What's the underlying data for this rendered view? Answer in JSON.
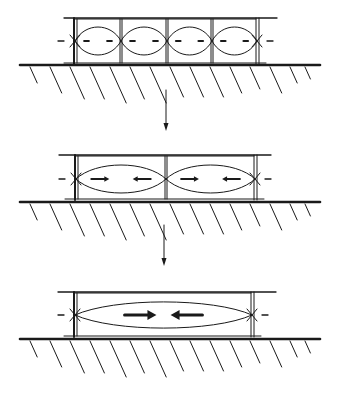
{
  "diagram": {
    "title": "",
    "colors": {
      "ink": "#1a1a1a",
      "background": "#ffffff"
    },
    "panels": [
      {
        "id": "panel-1",
        "cells": 4,
        "box": {
          "x0": 74,
          "x1": 256,
          "top": 19,
          "bottom": 63
        },
        "top_line": {
          "x0": 64,
          "x1": 277,
          "y": 18
        },
        "ground_y": 65,
        "node_y": 41,
        "amplitude": 15,
        "arrow_style": "dash",
        "dividers": [
          120,
          166,
          211
        ]
      },
      {
        "id": "panel-2",
        "cells": 2,
        "box": {
          "x0": 75,
          "x1": 254,
          "top": 156,
          "bottom": 199
        },
        "top_line": {
          "x0": 59,
          "x1": 271,
          "y": 155
        },
        "ground_y": 202,
        "node_y": 179,
        "amplitude": 15,
        "arrow_style": "small-arrow",
        "dividers": [
          165
        ]
      },
      {
        "id": "panel-3",
        "cells": 1,
        "box": {
          "x0": 74,
          "x1": 251,
          "top": 293,
          "bottom": 336
        },
        "top_line": {
          "x0": 58,
          "x1": 276,
          "y": 292
        },
        "ground_y": 339,
        "node_y": 315,
        "amplitude": 14,
        "arrow_style": "large-arrow",
        "dividers": []
      }
    ],
    "transition_arrows": [
      {
        "x": 166,
        "y0": 90,
        "y1": 131
      },
      {
        "x": 164,
        "y0": 225,
        "y1": 266
      }
    ]
  }
}
